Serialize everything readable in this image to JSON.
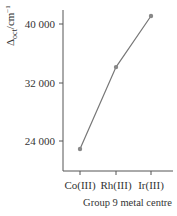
{
  "chart_data": {
    "type": "line",
    "title": "",
    "xlabel": "Group 9 metal centre",
    "ylabel": "Δoct/cm−1",
    "ylabel_main": "Δ",
    "ylabel_sub": "oct",
    "ylabel_unit": "/cm",
    "ylabel_sup": "−1",
    "categories": [
      "Co(III)",
      "Rh(III)",
      "Ir(III)"
    ],
    "values": [
      22900,
      34100,
      41100
    ],
    "yticks": [
      24000,
      32000,
      40000
    ],
    "ytick_labels": [
      "24 000",
      "32 000",
      "40 000"
    ],
    "ylim": [
      20600,
      42700
    ],
    "grid": false,
    "legend": null,
    "line_color": "#777777",
    "marker_color": "#888888"
  }
}
